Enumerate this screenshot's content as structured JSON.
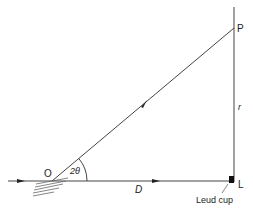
{
  "diagram": {
    "type": "geometry",
    "labels": {
      "origin": "O",
      "angle": "2θ",
      "distance": "D",
      "radius": "r",
      "point_p": "P",
      "point_l": "L",
      "lead_cup": "Leud cup"
    },
    "points": {
      "O": [
        52,
        181
      ],
      "L": [
        234,
        181
      ],
      "P": [
        234,
        28
      ]
    },
    "colors": {
      "line": "#444444",
      "text": "#222222",
      "cup": "#111111"
    }
  }
}
